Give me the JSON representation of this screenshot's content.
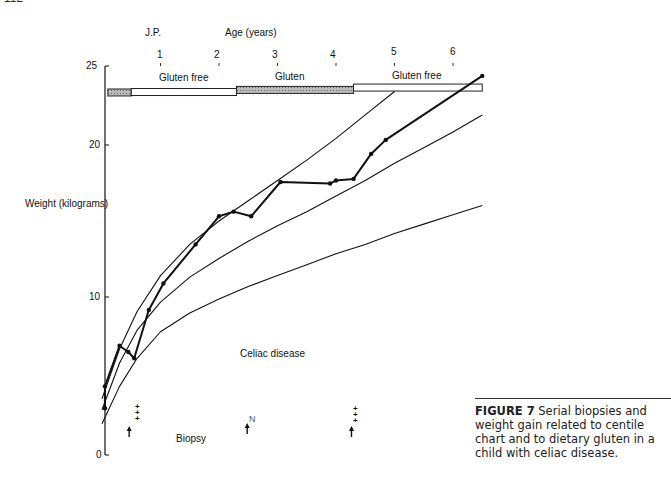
{
  "page": {
    "page_number": "112"
  },
  "chart_data": {
    "type": "line",
    "title": "J.P.",
    "xlabel": "Age (years)",
    "ylabel": "Weight (kilograms)",
    "x_ticks": [
      1,
      2,
      3,
      4,
      5,
      6
    ],
    "y_ticks": [
      0,
      10,
      20,
      25
    ],
    "xlim": [
      0,
      6.5
    ],
    "ylim": [
      0,
      25
    ],
    "grid": false,
    "annotation": "Celiac disease",
    "diet_bar": [
      {
        "label": "",
        "from": 0.1,
        "to": 0.5,
        "type": "gluten"
      },
      {
        "label": "Gluten free",
        "from": 0.5,
        "to": 2.3,
        "type": "gluten-free"
      },
      {
        "label": "Gluten",
        "from": 2.3,
        "to": 4.3,
        "type": "gluten"
      },
      {
        "label": "Gluten free",
        "from": 4.3,
        "to": 6.5,
        "type": "gluten-free"
      }
    ],
    "series": [
      {
        "name": "Patient weight",
        "style": "thick-with-markers",
        "x": [
          0.05,
          0.05,
          0.3,
          0.45,
          0.55,
          0.8,
          1.05,
          1.6,
          2.0,
          2.25,
          2.55,
          3.05,
          3.9,
          4.0,
          4.3,
          4.6,
          4.85,
          6.5
        ],
        "y": [
          3.0,
          4.4,
          7.0,
          6.6,
          6.2,
          9.3,
          11.0,
          13.5,
          15.3,
          15.6,
          15.3,
          17.5,
          17.4,
          17.6,
          17.7,
          19.3,
          20.2,
          24.3
        ]
      },
      {
        "name": "Upper centile",
        "style": "thin",
        "x": [
          0,
          0.3,
          0.6,
          1.0,
          1.5,
          2.0,
          2.5,
          3.0,
          3.5,
          4.0,
          4.5,
          5.0
        ],
        "y": [
          3.6,
          6.8,
          9.2,
          11.5,
          13.5,
          15.0,
          16.3,
          17.6,
          18.9,
          20.3,
          21.8,
          23.3
        ]
      },
      {
        "name": "Middle centile",
        "style": "thin",
        "x": [
          0,
          0.3,
          0.6,
          1.0,
          1.5,
          2.0,
          2.5,
          3.0,
          3.5,
          4.0,
          4.5,
          5.0,
          5.5,
          6.0,
          6.5
        ],
        "y": [
          2.9,
          5.9,
          8.0,
          9.8,
          11.4,
          12.6,
          13.7,
          14.7,
          15.6,
          16.6,
          17.6,
          18.7,
          19.7,
          20.7,
          21.8
        ]
      },
      {
        "name": "Lower centile",
        "style": "thin",
        "x": [
          0,
          0.3,
          0.6,
          1.0,
          1.5,
          2.0,
          2.5,
          3.0,
          3.5,
          4.0,
          4.5,
          5.0,
          5.5,
          6.0,
          6.5
        ],
        "y": [
          2.0,
          4.4,
          6.2,
          7.9,
          9.1,
          10.0,
          10.8,
          11.5,
          12.2,
          12.9,
          13.5,
          14.2,
          14.8,
          15.4,
          16.0
        ]
      }
    ],
    "biopsies": [
      {
        "age": 0.55,
        "grade": "+++",
        "label": "Biopsy"
      },
      {
        "age": 2.55,
        "grade": "N",
        "label": ""
      },
      {
        "age": 4.35,
        "grade": "+++",
        "label": ""
      }
    ]
  },
  "labels": {
    "title": "J.P.",
    "xlabel": "Age (years)",
    "ylabel": "Weight (kilograms)",
    "annotation": "Celiac disease",
    "biopsy": "Biopsy",
    "y25": "25",
    "y20": "20",
    "y10": "10",
    "y0": "0",
    "x1": "1",
    "x2": "2",
    "x3": "3",
    "x4": "4",
    "x5": "5",
    "x6": "6",
    "diet1": "Gluten free",
    "diet2": "Gluten",
    "diet3": "Gluten free",
    "biopsy1": "+\n+\n+",
    "biopsy2": "N",
    "biopsy3": "+\n+\n+"
  },
  "caption": {
    "figure_label": "FIGURE 7",
    "text": "Serial biopsies and weight gain related to centile chart and to dietary gluten in a child with celiac disease."
  }
}
